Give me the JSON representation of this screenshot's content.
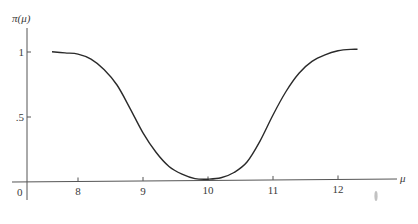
{
  "chart_data": {
    "type": "line",
    "title": "",
    "xlabel": "μ",
    "ylabel": "π(μ)",
    "xlim": [
      7.2,
      13.0
    ],
    "ylim": [
      0,
      1.1
    ],
    "grid": false,
    "legend": null,
    "x_ticks": [
      {
        "value": 8,
        "label": "8"
      },
      {
        "value": 9,
        "label": "9"
      },
      {
        "value": 10,
        "label": "10"
      },
      {
        "value": 11,
        "label": "11"
      },
      {
        "value": 12,
        "label": "12"
      }
    ],
    "y_ticks": [
      {
        "value": 0.5,
        "label": ".5"
      },
      {
        "value": 1,
        "label": "1"
      }
    ],
    "origin_label": "0",
    "series": [
      {
        "name": "power function π(μ)",
        "color": "#2a2a2a",
        "x": [
          7.6,
          7.8,
          8.0,
          8.2,
          8.4,
          8.6,
          8.8,
          9.0,
          9.2,
          9.4,
          9.6,
          9.8,
          10.0,
          10.2,
          10.4,
          10.6,
          10.8,
          11.0,
          11.2,
          11.4,
          11.6,
          11.8,
          12.0,
          12.2,
          12.3
        ],
        "values": [
          1.0,
          0.99,
          0.98,
          0.94,
          0.86,
          0.74,
          0.56,
          0.37,
          0.22,
          0.11,
          0.05,
          0.015,
          0.01,
          0.02,
          0.06,
          0.14,
          0.3,
          0.5,
          0.68,
          0.82,
          0.91,
          0.96,
          0.99,
          1.0,
          1.0
        ]
      }
    ],
    "annotations": []
  }
}
